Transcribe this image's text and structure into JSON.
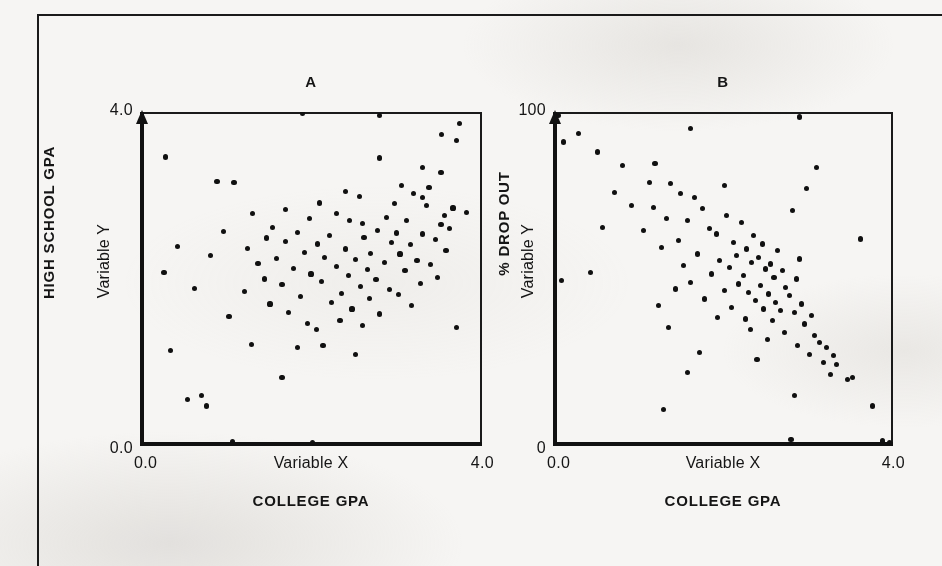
{
  "figure": {
    "background_color": "#f6f5f3",
    "ink_color": "#151515",
    "panels": [
      {
        "id": "A",
        "title": "A",
        "y_axis": {
          "bold_label": "HIGH SCHOOL GPA",
          "variable_label": "Variable Y",
          "tick_top": "4.0",
          "tick_bottom": "0.0"
        },
        "x_axis": {
          "variable_label": "Variable X",
          "bold_label": "COLLEGE GPA",
          "tick_left": "0.0",
          "tick_right": "4.0"
        }
      },
      {
        "id": "B",
        "title": "B",
        "y_axis": {
          "bold_label": "% DROP OUT",
          "variable_label": "Variable Y",
          "tick_top": "100",
          "tick_bottom": "0"
        },
        "x_axis": {
          "variable_label": "Variable X",
          "bold_label": "COLLEGE GPA",
          "tick_left": "0.0",
          "tick_right": "4.0"
        }
      }
    ]
  },
  "chart_data": [
    {
      "type": "scatter",
      "title": "A",
      "xlabel": "Variable X / COLLEGE GPA",
      "ylabel": "Variable Y / HIGH SCHOOL GPA",
      "xlim": [
        0.0,
        4.0
      ],
      "ylim": [
        0.0,
        4.0
      ],
      "xticks": [
        "0.0",
        "4.0"
      ],
      "yticks": [
        "0.0",
        "4.0"
      ],
      "grid": false,
      "legend": null,
      "relationship": "positive correlation",
      "points": [
        [
          1.9,
          3.98
        ],
        [
          2.8,
          3.96
        ],
        [
          3.74,
          3.86
        ],
        [
          3.53,
          3.73
        ],
        [
          3.7,
          3.66
        ],
        [
          0.3,
          3.46
        ],
        [
          2.8,
          3.45
        ],
        [
          3.3,
          3.34
        ],
        [
          3.52,
          3.28
        ],
        [
          0.9,
          3.17
        ],
        [
          1.1,
          3.16
        ],
        [
          3.06,
          3.12
        ],
        [
          3.38,
          3.1
        ],
        [
          2.4,
          3.05
        ],
        [
          3.2,
          3.02
        ],
        [
          2.57,
          2.99
        ],
        [
          3.3,
          2.98
        ],
        [
          2.1,
          2.91
        ],
        [
          2.98,
          2.9
        ],
        [
          3.35,
          2.88
        ],
        [
          3.66,
          2.85
        ],
        [
          1.7,
          2.83
        ],
        [
          3.82,
          2.8
        ],
        [
          1.32,
          2.78
        ],
        [
          2.3,
          2.78
        ],
        [
          3.56,
          2.76
        ],
        [
          2.88,
          2.74
        ],
        [
          1.98,
          2.72
        ],
        [
          2.45,
          2.7
        ],
        [
          3.12,
          2.7
        ],
        [
          2.6,
          2.66
        ],
        [
          3.52,
          2.65
        ],
        [
          1.55,
          2.62
        ],
        [
          3.62,
          2.6
        ],
        [
          2.78,
          2.58
        ],
        [
          0.98,
          2.57
        ],
        [
          1.84,
          2.56
        ],
        [
          3.0,
          2.55
        ],
        [
          3.3,
          2.54
        ],
        [
          2.22,
          2.52
        ],
        [
          2.62,
          2.5
        ],
        [
          1.48,
          2.49
        ],
        [
          3.46,
          2.47
        ],
        [
          1.7,
          2.45
        ],
        [
          2.94,
          2.44
        ],
        [
          2.08,
          2.42
        ],
        [
          3.16,
          2.41
        ],
        [
          0.44,
          2.39
        ],
        [
          1.26,
          2.37
        ],
        [
          2.4,
          2.36
        ],
        [
          3.58,
          2.34
        ],
        [
          1.92,
          2.32
        ],
        [
          2.7,
          2.31
        ],
        [
          3.04,
          2.3
        ],
        [
          0.82,
          2.28
        ],
        [
          2.16,
          2.26
        ],
        [
          1.6,
          2.25
        ],
        [
          2.52,
          2.23
        ],
        [
          3.24,
          2.22
        ],
        [
          2.86,
          2.2
        ],
        [
          1.38,
          2.19
        ],
        [
          3.4,
          2.17
        ],
        [
          2.3,
          2.15
        ],
        [
          1.8,
          2.13
        ],
        [
          2.66,
          2.11
        ],
        [
          3.1,
          2.1
        ],
        [
          0.28,
          2.08
        ],
        [
          2.0,
          2.06
        ],
        [
          2.44,
          2.04
        ],
        [
          3.48,
          2.02
        ],
        [
          1.46,
          2.0
        ],
        [
          2.76,
          1.99
        ],
        [
          2.12,
          1.97
        ],
        [
          3.28,
          1.95
        ],
        [
          1.66,
          1.93
        ],
        [
          2.58,
          1.91
        ],
        [
          0.64,
          1.89
        ],
        [
          2.92,
          1.87
        ],
        [
          1.22,
          1.85
        ],
        [
          2.36,
          1.83
        ],
        [
          3.02,
          1.81
        ],
        [
          1.88,
          1.79
        ],
        [
          2.68,
          1.77
        ],
        [
          2.24,
          1.72
        ],
        [
          1.52,
          1.7
        ],
        [
          3.18,
          1.68
        ],
        [
          2.48,
          1.64
        ],
        [
          1.74,
          1.6
        ],
        [
          2.8,
          1.58
        ],
        [
          1.04,
          1.55
        ],
        [
          2.34,
          1.5
        ],
        [
          1.96,
          1.47
        ],
        [
          2.6,
          1.44
        ],
        [
          3.7,
          1.42
        ],
        [
          2.06,
          1.4
        ],
        [
          1.3,
          1.22
        ],
        [
          2.14,
          1.2
        ],
        [
          1.84,
          1.18
        ],
        [
          0.36,
          1.14
        ],
        [
          2.52,
          1.1
        ],
        [
          0.72,
          0.6
        ],
        [
          0.78,
          0.48
        ],
        [
          0.56,
          0.56
        ],
        [
          1.66,
          0.82
        ],
        [
          1.08,
          0.05
        ],
        [
          2.02,
          0.04
        ]
      ]
    },
    {
      "type": "scatter",
      "title": "B",
      "xlabel": "Variable X / COLLEGE GPA",
      "ylabel": "Variable Y / % DROP OUT",
      "xlim": [
        0.0,
        4.0
      ],
      "ylim": [
        0,
        100
      ],
      "xticks": [
        "0.0",
        "4.0"
      ],
      "yticks": [
        "0",
        "100"
      ],
      "grid": false,
      "legend": null,
      "relationship": "negative correlation",
      "points": [
        [
          0.06,
          99.0
        ],
        [
          2.9,
          98.5
        ],
        [
          1.62,
          95.0
        ],
        [
          0.3,
          93.5
        ],
        [
          0.12,
          91.0
        ],
        [
          0.52,
          88.0
        ],
        [
          0.82,
          84.0
        ],
        [
          1.2,
          84.5
        ],
        [
          3.1,
          83.5
        ],
        [
          1.14,
          79.0
        ],
        [
          1.38,
          78.5
        ],
        [
          2.02,
          78.0
        ],
        [
          2.98,
          77.0
        ],
        [
          0.72,
          76.0
        ],
        [
          1.5,
          75.5
        ],
        [
          1.66,
          74.5
        ],
        [
          0.92,
          72.0
        ],
        [
          1.18,
          71.5
        ],
        [
          1.76,
          71.0
        ],
        [
          2.82,
          70.5
        ],
        [
          2.04,
          69.0
        ],
        [
          1.34,
          68.0
        ],
        [
          1.58,
          67.5
        ],
        [
          2.22,
          67.0
        ],
        [
          0.58,
          65.5
        ],
        [
          1.84,
          65.0
        ],
        [
          1.06,
          64.5
        ],
        [
          1.92,
          63.5
        ],
        [
          2.36,
          63.0
        ],
        [
          3.62,
          62.0
        ],
        [
          1.48,
          61.5
        ],
        [
          2.12,
          61.0
        ],
        [
          2.46,
          60.5
        ],
        [
          1.28,
          59.5
        ],
        [
          2.28,
          59.0
        ],
        [
          2.64,
          58.5
        ],
        [
          1.7,
          57.5
        ],
        [
          2.16,
          57.0
        ],
        [
          2.42,
          56.5
        ],
        [
          2.9,
          56.0
        ],
        [
          1.96,
          55.5
        ],
        [
          2.34,
          55.0
        ],
        [
          2.56,
          54.5
        ],
        [
          1.54,
          54.0
        ],
        [
          2.08,
          53.5
        ],
        [
          2.5,
          53.0
        ],
        [
          2.7,
          52.5
        ],
        [
          0.44,
          52.0
        ],
        [
          1.86,
          51.5
        ],
        [
          2.24,
          51.0
        ],
        [
          2.6,
          50.5
        ],
        [
          2.86,
          50.0
        ],
        [
          0.1,
          49.5
        ],
        [
          1.62,
          49.0
        ],
        [
          2.18,
          48.5
        ],
        [
          2.44,
          48.0
        ],
        [
          2.74,
          47.5
        ],
        [
          1.44,
          47.0
        ],
        [
          2.02,
          46.5
        ],
        [
          2.3,
          46.0
        ],
        [
          2.54,
          45.5
        ],
        [
          2.78,
          45.0
        ],
        [
          1.78,
          44.0
        ],
        [
          2.38,
          43.5
        ],
        [
          2.62,
          43.0
        ],
        [
          2.92,
          42.5
        ],
        [
          1.24,
          42.0
        ],
        [
          2.1,
          41.5
        ],
        [
          2.48,
          41.0
        ],
        [
          2.68,
          40.5
        ],
        [
          2.84,
          40.0
        ],
        [
          3.04,
          39.0
        ],
        [
          1.94,
          38.5
        ],
        [
          2.26,
          38.0
        ],
        [
          2.58,
          37.5
        ],
        [
          2.96,
          36.5
        ],
        [
          1.36,
          35.5
        ],
        [
          2.32,
          35.0
        ],
        [
          2.72,
          34.0
        ],
        [
          3.08,
          33.0
        ],
        [
          2.52,
          32.0
        ],
        [
          3.14,
          31.0
        ],
        [
          2.88,
          30.0
        ],
        [
          3.22,
          29.5
        ],
        [
          1.72,
          28.0
        ],
        [
          3.02,
          27.5
        ],
        [
          3.3,
          27.0
        ],
        [
          2.4,
          26.0
        ],
        [
          3.18,
          25.0
        ],
        [
          3.34,
          24.5
        ],
        [
          1.58,
          22.0
        ],
        [
          3.26,
          21.5
        ],
        [
          3.46,
          20.0
        ],
        [
          3.52,
          20.5
        ],
        [
          2.84,
          15.0
        ],
        [
          3.76,
          12.0
        ],
        [
          1.3,
          11.0
        ],
        [
          2.8,
          2.0
        ],
        [
          3.96,
          1.0
        ],
        [
          3.88,
          1.5
        ]
      ]
    }
  ]
}
